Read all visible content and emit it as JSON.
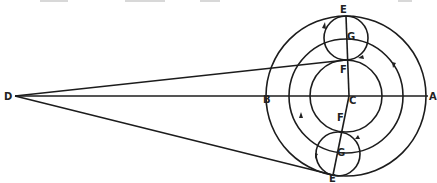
{
  "diagram": {
    "type": "geometric-figure",
    "colors": {
      "ink": "#1c1c1c",
      "background": "#ffffff"
    },
    "labels": {
      "A": "A",
      "B": "B",
      "C": "C",
      "D": "D",
      "E_top": "E",
      "E_bottom": "E",
      "F_top": "F",
      "F_bottom": "F",
      "G_top": "G",
      "G_bottom": "G"
    },
    "points": {
      "A": [
        426,
        96
      ],
      "B": [
        289,
        96
      ],
      "C": [
        346,
        96
      ],
      "D": [
        15,
        96
      ],
      "E_top": [
        346,
        16
      ],
      "F_top": [
        346,
        60
      ],
      "G_top": [
        346,
        38
      ],
      "E_bottom": [
        333,
        175
      ],
      "F_bottom": [
        342,
        132
      ],
      "G_bottom": [
        338,
        154
      ]
    },
    "circles": [
      {
        "name": "outer",
        "cx": 346,
        "cy": 96,
        "r": 80
      },
      {
        "name": "middle",
        "cx": 346,
        "cy": 96,
        "r": 57
      },
      {
        "name": "inner",
        "cx": 346,
        "cy": 96,
        "r": 36
      },
      {
        "name": "small-top",
        "cx": 346,
        "cy": 38,
        "r": 22
      },
      {
        "name": "small-bottom",
        "cx": 338,
        "cy": 154,
        "r": 22
      }
    ]
  }
}
